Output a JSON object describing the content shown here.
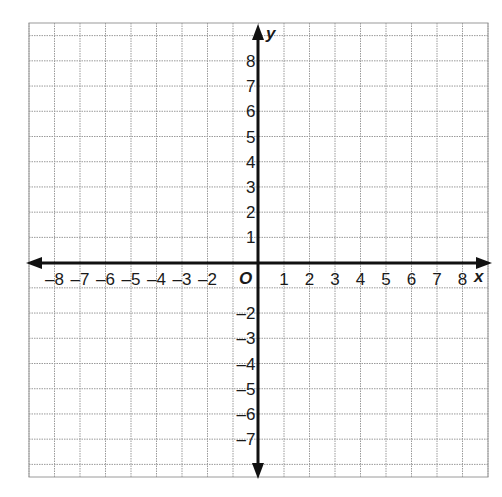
{
  "chart_data": {
    "type": "scatter",
    "title": "",
    "xlabel": "x",
    "ylabel": "y",
    "origin_label": "O",
    "xlim": [
      -9,
      9
    ],
    "ylim": [
      -8,
      9
    ],
    "grid": true,
    "x_tick_labels": [
      "-8",
      "-7",
      "-6",
      "-5",
      "-4",
      "-3",
      "-2",
      "1",
      "2",
      "3",
      "4",
      "5",
      "6",
      "7",
      "8"
    ],
    "x_tick_values": [
      -8,
      -7,
      -6,
      -5,
      -4,
      -3,
      -2,
      1,
      2,
      3,
      4,
      5,
      6,
      7,
      8
    ],
    "y_tick_labels": [
      "8",
      "7",
      "6",
      "5",
      "4",
      "3",
      "2",
      "1",
      "-2",
      "-3",
      "-4",
      "-5",
      "-6",
      "-7"
    ],
    "y_tick_values": [
      8,
      7,
      6,
      5,
      4,
      3,
      2,
      1,
      -2,
      -3,
      -4,
      -5,
      -6,
      -7
    ],
    "series": []
  },
  "colors": {
    "grid": "#9a9a9a",
    "axis": "#111111",
    "text": "#1a1a1a",
    "background": "#ffffff"
  }
}
